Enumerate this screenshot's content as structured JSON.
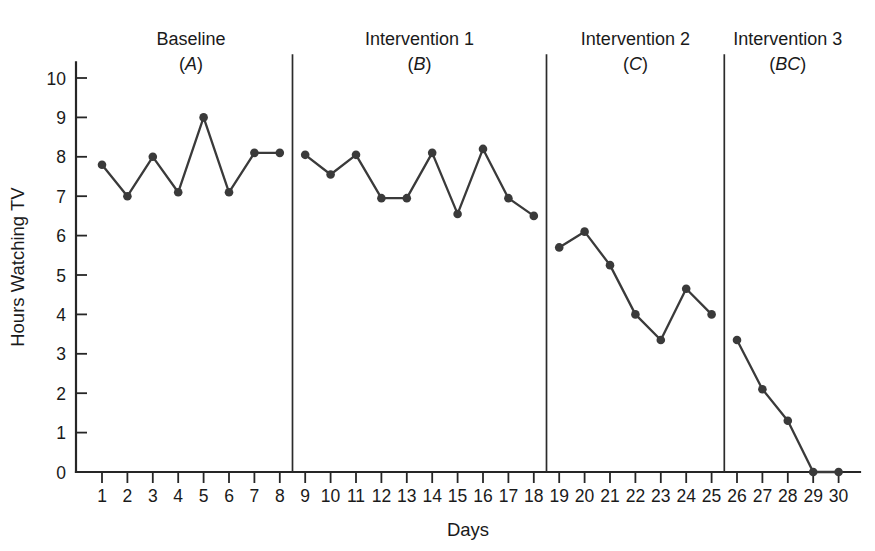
{
  "chart_data": {
    "type": "line",
    "title": "",
    "xlabel": "Days",
    "ylabel": "Hours Watching TV",
    "xlim": [
      0,
      31
    ],
    "ylim": [
      0,
      10
    ],
    "grid": false,
    "legend": "none",
    "x": [
      1,
      2,
      3,
      4,
      5,
      6,
      7,
      8,
      9,
      10,
      11,
      12,
      13,
      14,
      15,
      16,
      17,
      18,
      19,
      20,
      21,
      22,
      23,
      24,
      25,
      26,
      27,
      28,
      29,
      30
    ],
    "y_tick_labels": [
      "0",
      "1",
      "2",
      "3",
      "4",
      "5",
      "6",
      "7",
      "8",
      "9",
      "10"
    ],
    "x_tick_labels": [
      "1",
      "2",
      "3",
      "4",
      "5",
      "6",
      "7",
      "8",
      "9",
      "10",
      "11",
      "12",
      "13",
      "14",
      "15",
      "16",
      "17",
      "18",
      "19",
      "20",
      "21",
      "22",
      "23",
      "24",
      "25",
      "26",
      "27",
      "28",
      "29",
      "30"
    ],
    "series": [
      {
        "name": "Baseline (A)",
        "x": [
          1,
          2,
          3,
          4,
          5,
          6,
          7,
          8
        ],
        "values": [
          7.8,
          7.0,
          8.0,
          7.1,
          9.0,
          7.1,
          8.1,
          8.1
        ]
      },
      {
        "name": "Intervention 1 (B)",
        "x": [
          9,
          10,
          11,
          12,
          13,
          14,
          15,
          16,
          17,
          18
        ],
        "values": [
          8.05,
          7.55,
          8.05,
          6.95,
          6.95,
          8.1,
          6.55,
          8.2,
          6.95,
          6.5
        ]
      },
      {
        "name": "Intervention 2 (C)",
        "x": [
          19,
          20,
          21,
          22,
          23,
          24,
          25
        ],
        "values": [
          5.7,
          6.1,
          5.25,
          4.0,
          3.35,
          4.65,
          4.0
        ]
      },
      {
        "name": "Intervention 3 (BC)",
        "x": [
          26,
          27,
          28,
          29,
          30
        ],
        "values": [
          3.35,
          2.1,
          1.3,
          0.0,
          0.0
        ]
      }
    ],
    "phases": [
      {
        "label": "Baseline",
        "code": "A",
        "x_start": 1,
        "x_end": 8,
        "center_x": 4.5
      },
      {
        "label": "Intervention 1",
        "code": "B",
        "x_start": 9,
        "x_end": 18,
        "center_x": 13.5
      },
      {
        "label": "Intervention 2",
        "code": "C",
        "x_start": 19,
        "x_end": 25,
        "center_x": 22.0
      },
      {
        "label": "Intervention 3",
        "code": "BC",
        "x_start": 26,
        "x_end": 30,
        "center_x": 28.0
      }
    ],
    "phase_dividers": [
      8.5,
      18.5,
      25.5
    ],
    "colors": {
      "line": "#3a3a3a",
      "marker": "#3a3a3a",
      "axis": "#262626",
      "divider": "#2b2b2b",
      "background": "#ffffff",
      "text": "#1a1a1a"
    }
  }
}
